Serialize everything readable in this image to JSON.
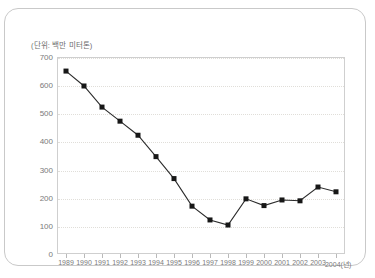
{
  "card": {
    "unit_label": "(단위: 백만 미터톤)"
  },
  "chart_data": {
    "type": "line",
    "title": "",
    "subtitle": "",
    "xlabel": "년",
    "ylabel": "",
    "unit": "(단위: 백만 미터톤)",
    "grid": true,
    "legend": false,
    "xlim": [
      1989,
      2004
    ],
    "ylim": [
      0,
      700
    ],
    "ytick_labels": [
      "700",
      "600",
      "500",
      "400",
      "300",
      "200",
      "100",
      "0"
    ],
    "yticks": [
      700,
      600,
      500,
      400,
      300,
      200,
      100,
      0
    ],
    "categories": [
      "1989",
      "1990",
      "1991",
      "1992",
      "1993",
      "1994",
      "1995",
      "1996",
      "1997",
      "1998",
      "1999",
      "2000",
      "2001",
      "2002",
      "2003",
      "2004(년)"
    ],
    "values": [
      650,
      597,
      522,
      472,
      422,
      346,
      268,
      170,
      121,
      103,
      196,
      172,
      192,
      189,
      238,
      221
    ],
    "series": [
      {
        "name": "",
        "values": [
          650,
          597,
          522,
          472,
          422,
          346,
          268,
          170,
          121,
          103,
          196,
          172,
          192,
          189,
          238,
          221
        ],
        "color": "#2b2b2b",
        "marker": "square"
      }
    ]
  }
}
